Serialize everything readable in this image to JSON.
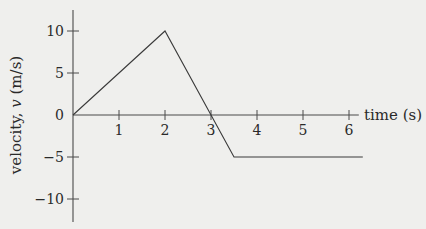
{
  "chart_data": {
    "type": "line",
    "title": "",
    "xlabel": "time (s)",
    "ylabel": "velocity, v (m/s)",
    "ylabel_parts": {
      "prefix": "velocity, ",
      "var": "v",
      "suffix": " (m/s)"
    },
    "xlim": [
      0,
      6.3
    ],
    "ylim": [
      -12.5,
      12.5
    ],
    "x_ticks": [
      1,
      2,
      3,
      4,
      5,
      6
    ],
    "x_tick_labels": [
      "1",
      "2",
      "3",
      "4",
      "5",
      "6"
    ],
    "y_ticks": [
      10,
      5,
      0,
      -5,
      -10
    ],
    "y_tick_labels": [
      "10",
      "5",
      "0",
      "−5",
      "−10"
    ],
    "grid": false,
    "legend": null,
    "series": [
      {
        "name": "velocity",
        "x": [
          0,
          2,
          3,
          3.5,
          6.3
        ],
        "y": [
          0,
          10,
          0,
          -5,
          -5
        ]
      }
    ],
    "colors": {
      "line": "#3a3a3a",
      "axis": "#4a4a4a",
      "background": "#efefed"
    }
  }
}
